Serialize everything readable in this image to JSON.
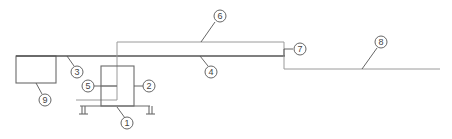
{
  "diagram": {
    "type": "schematic line drawing with numbered callouts",
    "callouts": [
      {
        "id": "1",
        "label": "1",
        "target": "base frame / platform"
      },
      {
        "id": "2",
        "label": "2",
        "target": "right side of central housing"
      },
      {
        "id": "3",
        "label": "3",
        "target": "main horizontal beam (left section)"
      },
      {
        "id": "4",
        "label": "4",
        "target": "main horizontal beam (middle section)"
      },
      {
        "id": "5",
        "label": "5",
        "target": "inner post of central housing"
      },
      {
        "id": "6",
        "label": "6",
        "target": "upper thin rectangular frame"
      },
      {
        "id": "7",
        "label": "7",
        "target": "right end of upper frame"
      },
      {
        "id": "8",
        "label": "8",
        "target": "long thin extension line"
      },
      {
        "id": "9",
        "label": "9",
        "target": "left box"
      }
    ],
    "colors": {
      "line_dark": "#555555",
      "line_light": "#9a9a9a",
      "background": "#ffffff"
    }
  }
}
